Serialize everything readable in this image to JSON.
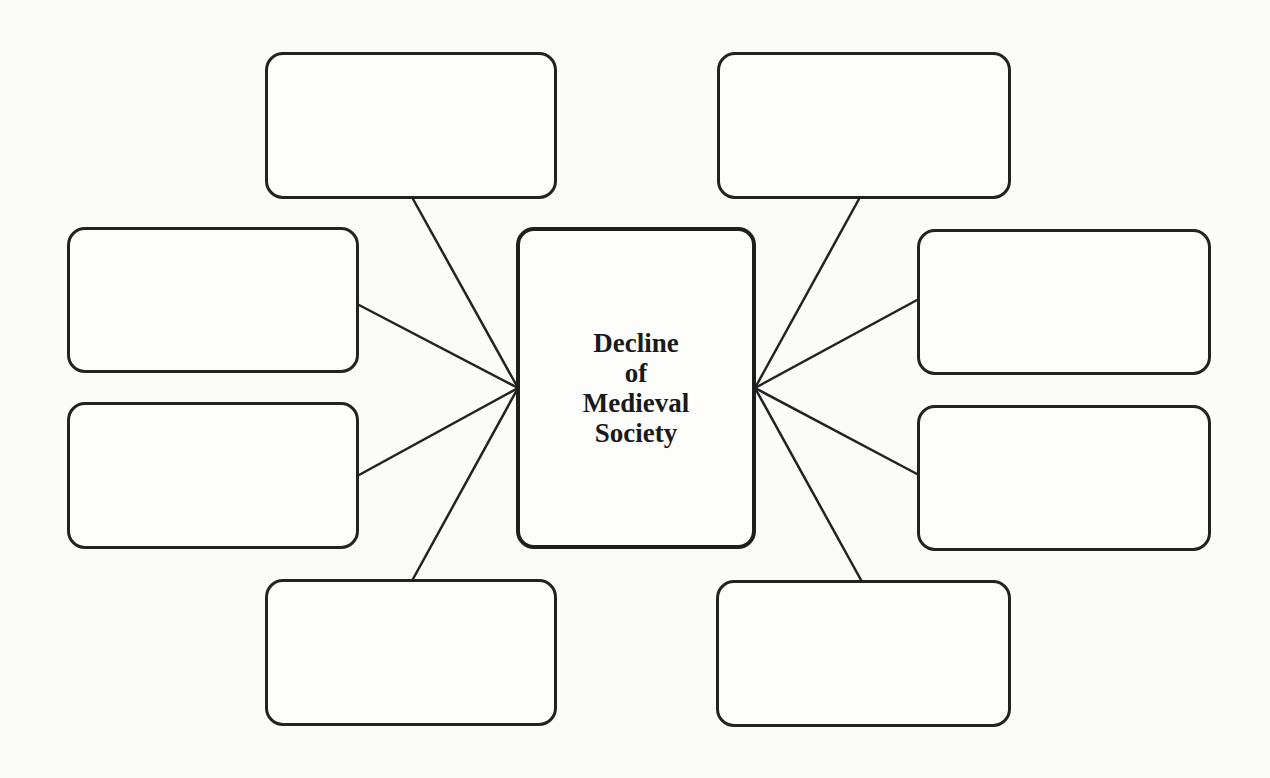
{
  "diagram": {
    "type": "concept-web",
    "center": {
      "title": "Decline\nof\nMedieval\nSociety",
      "lines": [
        "Decline",
        "of",
        "Medieval",
        "Society"
      ],
      "box": {
        "x": 516,
        "y": 227,
        "w": 240,
        "h": 322
      }
    },
    "satellites": [
      {
        "id": "top-left",
        "text": "",
        "box": {
          "x": 265,
          "y": 52,
          "w": 292,
          "h": 147
        },
        "line": {
          "x1": 413,
          "y1": 199,
          "x2": 518,
          "y2": 388
        }
      },
      {
        "id": "top-right",
        "text": "",
        "box": {
          "x": 717,
          "y": 52,
          "w": 294,
          "h": 147
        },
        "line": {
          "x1": 859,
          "y1": 199,
          "x2": 755,
          "y2": 388
        }
      },
      {
        "id": "left-upper",
        "text": "",
        "box": {
          "x": 67,
          "y": 227,
          "w": 292,
          "h": 146
        },
        "line": {
          "x1": 359,
          "y1": 305,
          "x2": 518,
          "y2": 388
        }
      },
      {
        "id": "left-lower",
        "text": "",
        "box": {
          "x": 67,
          "y": 402,
          "w": 292,
          "h": 147
        },
        "line": {
          "x1": 359,
          "y1": 475,
          "x2": 518,
          "y2": 388
        }
      },
      {
        "id": "right-upper",
        "text": "",
        "box": {
          "x": 917,
          "y": 229,
          "w": 294,
          "h": 146
        },
        "line": {
          "x1": 917,
          "y1": 300,
          "x2": 755,
          "y2": 388
        }
      },
      {
        "id": "right-lower",
        "text": "",
        "box": {
          "x": 917,
          "y": 405,
          "w": 294,
          "h": 146
        },
        "line": {
          "x1": 917,
          "y1": 474,
          "x2": 755,
          "y2": 388
        }
      },
      {
        "id": "bottom-left",
        "text": "",
        "box": {
          "x": 265,
          "y": 579,
          "w": 292,
          "h": 147
        },
        "line": {
          "x1": 413,
          "y1": 579,
          "x2": 518,
          "y2": 388
        }
      },
      {
        "id": "bottom-right",
        "text": "",
        "box": {
          "x": 716,
          "y": 580,
          "w": 295,
          "h": 147
        },
        "line": {
          "x1": 861,
          "y1": 580,
          "x2": 755,
          "y2": 388
        }
      }
    ],
    "colors": {
      "stroke": "#222222",
      "background": "#fbfbfa",
      "text": "#1a1a1a"
    }
  }
}
